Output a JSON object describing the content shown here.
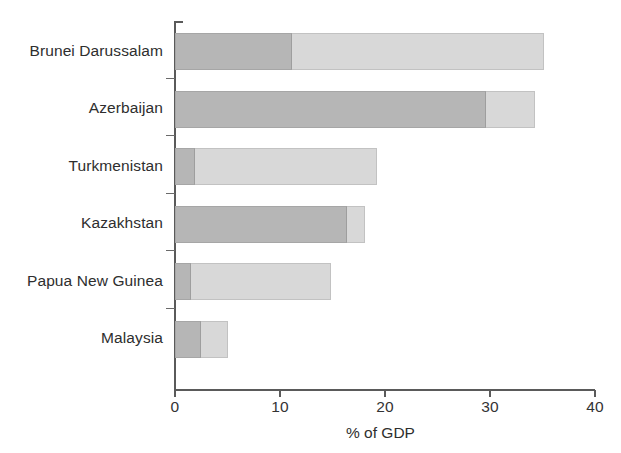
{
  "chart_data": {
    "type": "bar",
    "orientation": "horizontal",
    "stacked": true,
    "title": "",
    "xlabel": "% of GDP",
    "ylabel": "",
    "xlim": [
      0,
      40
    ],
    "xticks": [
      0,
      10,
      20,
      30,
      40
    ],
    "xtick_labels": [
      "0",
      "10",
      "20",
      "30",
      "40"
    ],
    "grid": false,
    "legend": "none",
    "categories": [
      "Brunei Darussalam",
      "Azerbaijan",
      "Turkmenistan",
      "Kazakhstan",
      "Papua New Guinea",
      "Malaysia"
    ],
    "series": [
      {
        "name": "dark-segment",
        "color": "#b6b6b6",
        "values": [
          11.1,
          29.6,
          1.9,
          16.4,
          1.5,
          2.5
        ]
      },
      {
        "name": "light-segment",
        "color": "#d8d8d8",
        "values": [
          24.0,
          4.7,
          17.3,
          1.7,
          13.4,
          2.5
        ]
      }
    ],
    "totals": [
      35.1,
      34.3,
      19.2,
      18.1,
      14.9,
      5.0
    ]
  },
  "axis": {
    "x_title": "% of GDP"
  },
  "colors": {
    "dark": "#b6b6b6",
    "light": "#d8d8d8",
    "axis": "#5a5a5a",
    "text": "#2e2e2e",
    "background": "#ffffff"
  }
}
